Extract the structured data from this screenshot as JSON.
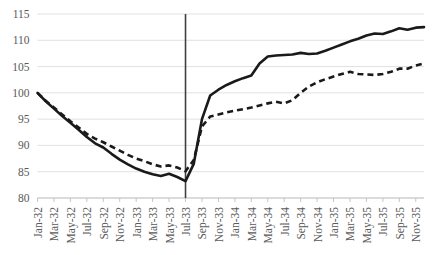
{
  "chart_data": {
    "type": "line",
    "title": "",
    "subtitle": "",
    "xlabel": "",
    "ylabel": "",
    "ylim": [
      80,
      115
    ],
    "yticks": [
      80,
      85,
      90,
      95,
      100,
      105,
      110,
      115
    ],
    "grid": true,
    "legend": "none",
    "x": [
      "Jan-32",
      "Feb-32",
      "Mar-32",
      "Apr-32",
      "May-32",
      "Jun-32",
      "Jul-32",
      "Aug-32",
      "Sep-32",
      "Oct-32",
      "Nov-32",
      "Dec-32",
      "Jan-33",
      "Feb-33",
      "Mar-33",
      "Apr-33",
      "May-33",
      "Jun-33",
      "Jul-33",
      "Aug-33",
      "Sep-33",
      "Oct-33",
      "Nov-33",
      "Dec-33",
      "Jan-34",
      "Feb-34",
      "Mar-34",
      "Apr-34",
      "May-34",
      "Jun-34",
      "Jul-34",
      "Aug-34",
      "Sep-34",
      "Oct-34",
      "Nov-34",
      "Dec-34",
      "Jan-35",
      "Feb-35",
      "Mar-35",
      "Apr-35",
      "May-35",
      "Jun-35",
      "Jul-35",
      "Aug-35",
      "Sep-35",
      "Oct-35",
      "Nov-35",
      "Dec-35"
    ],
    "xticks": [
      "Jan-32",
      "Mar-32",
      "May-32",
      "Jul-32",
      "Sep-32",
      "Nov-32",
      "Jan-33",
      "Mar-33",
      "May-33",
      "Jul-33",
      "Sep-33",
      "Nov-33",
      "Jan-34",
      "Mar-34",
      "May-34",
      "Jul-34",
      "Sep-34",
      "Nov-34",
      "Jan-35",
      "Mar-35",
      "May-35",
      "Jul-35",
      "Sep-35",
      "Nov-35"
    ],
    "series": [
      {
        "name": "solid-series",
        "style": "solid",
        "color": "#1a1a1a",
        "values": [
          100.0,
          98.4,
          97.0,
          95.6,
          94.3,
          93.0,
          91.6,
          90.4,
          89.6,
          88.4,
          87.3,
          86.4,
          85.6,
          85.0,
          84.5,
          84.2,
          84.6,
          84.0,
          83.2,
          86.5,
          95.0,
          99.5,
          100.6,
          101.5,
          102.2,
          102.8,
          103.3,
          105.6,
          106.9,
          107.1,
          107.2,
          107.3,
          107.6,
          107.4,
          107.5,
          108.0,
          108.6,
          109.2,
          109.8,
          110.3,
          110.9,
          111.3,
          111.2,
          111.7,
          112.3,
          112.0,
          112.4,
          112.5
        ]
      },
      {
        "name": "dashed-series",
        "style": "dashed",
        "color": "#1a1a1a",
        "values": [
          100.0,
          98.5,
          97.2,
          95.9,
          94.6,
          93.4,
          92.2,
          91.3,
          90.6,
          89.8,
          89.0,
          88.2,
          87.5,
          87.0,
          86.4,
          86.0,
          86.2,
          85.8,
          85.1,
          87.2,
          93.6,
          95.5,
          95.9,
          96.3,
          96.6,
          96.9,
          97.2,
          97.6,
          98.0,
          98.3,
          98.0,
          98.6,
          100.0,
          101.2,
          102.0,
          102.6,
          103.1,
          103.6,
          104.0,
          103.6,
          103.5,
          103.4,
          103.6,
          104.0,
          104.6,
          104.6,
          105.2,
          105.6
        ]
      }
    ],
    "annotations": [
      {
        "name": "event-divider",
        "type": "vertical-line",
        "x": "Jul-33",
        "color": "#404040"
      }
    ]
  }
}
